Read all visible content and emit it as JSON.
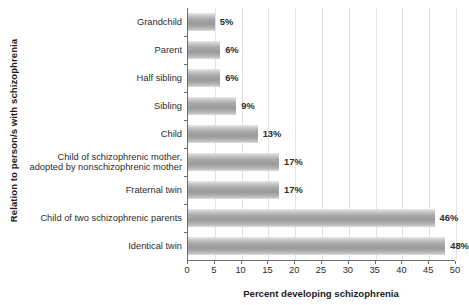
{
  "chart_data": {
    "type": "bar",
    "orientation": "horizontal",
    "title": "",
    "xlabel": "Percent developing schizophrenia",
    "ylabel": "Relation to person/s with schizophrenia",
    "xlim": [
      0,
      50
    ],
    "xticks": [
      0,
      5,
      10,
      15,
      20,
      25,
      30,
      35,
      40,
      45,
      50
    ],
    "grid": "vertical",
    "legend": "none",
    "categories": [
      "Grandchild",
      "Parent",
      "Half sibling",
      "Sibling",
      "Child",
      "Child of schizophrenic mother, adopted by nonschizophrenic mother",
      "Fraternal twin",
      "Child of two schizophrenic parents",
      "Identical twin"
    ],
    "category_lines": [
      [
        "Grandchild"
      ],
      [
        "Parent"
      ],
      [
        "Half sibling"
      ],
      [
        "Sibling"
      ],
      [
        "Child"
      ],
      [
        "Child of schizophrenic mother,",
        "adopted by nonschizophrenic mother"
      ],
      [
        "Fraternal twin"
      ],
      [
        "Child of two schizophrenic parents"
      ],
      [
        "Identical twin"
      ]
    ],
    "values": [
      5,
      6,
      6,
      9,
      13,
      17,
      17,
      46,
      48
    ],
    "value_labels": [
      "5%",
      "6%",
      "6%",
      "9%",
      "13%",
      "17%",
      "17%",
      "46%",
      "48%"
    ],
    "colors": {
      "bar_light": "#e3e3e3",
      "bar_dark": "#9a9a9a",
      "grid": "#e2e2e2",
      "axis": "#6d6d6d",
      "text": "#2b2b2b",
      "background": "#ffffff"
    }
  }
}
